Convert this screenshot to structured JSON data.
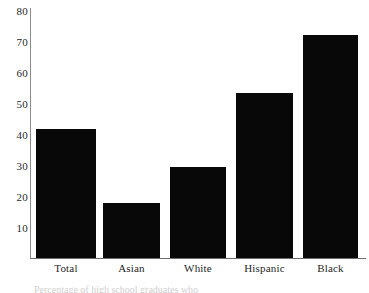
{
  "chart_data": {
    "type": "bar",
    "title": "",
    "subtitle": "",
    "xlabel": "",
    "ylabel": "",
    "categories": [
      "Total",
      "Asian",
      "White",
      "Hispanic",
      "Black"
    ],
    "values": [
      41.7,
      17.8,
      29.4,
      53.4,
      72.2
    ],
    "ylim": [
      0,
      80
    ],
    "yticks": [
      10,
      20,
      30,
      40,
      50,
      60,
      70,
      80
    ],
    "ytick_labels": [
      "10",
      "20",
      "30",
      "40",
      "50",
      "60",
      "70",
      "80"
    ],
    "grid": false,
    "legend": false,
    "legend_position": "none",
    "bar_color": "#080808",
    "axis_color": "#6d6d6d",
    "background": "#ffffff",
    "annotations": []
  },
  "axis": {
    "y_labels": [
      "80",
      "70",
      "60",
      "50",
      "40",
      "30",
      "20",
      "10"
    ],
    "x_labels": [
      "Total",
      "Asian",
      "White",
      "Hispanic",
      "Black"
    ]
  },
  "caption": {
    "clipped_text": "Percentage of high school graduates who"
  }
}
